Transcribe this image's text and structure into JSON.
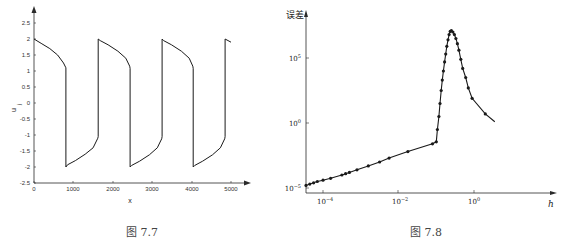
{
  "chart_data": [
    {
      "type": "line",
      "title": "",
      "caption": "图  7.7",
      "xlabel": "x",
      "ylabel": "u_j",
      "xlim": [
        0,
        5400
      ],
      "ylim": [
        -2.5,
        2.8
      ],
      "x_ticks": [
        "0",
        "1000",
        "2000",
        "3000",
        "4000",
        "5000"
      ],
      "y_ticks": [
        "2.5",
        "2",
        "1.5",
        "1",
        "0.5",
        "0",
        "-0.5",
        "-1",
        "-1.5",
        "-2",
        "-2.5"
      ],
      "grid": false,
      "series": [
        {
          "name": "u_j",
          "x": [
            0,
            200,
            400,
            600,
            750,
            810,
            810,
            850,
            1050,
            1300,
            1500,
            1620,
            1630,
            1630,
            1680,
            1880,
            2130,
            2330,
            2430,
            2440,
            2440,
            2480,
            2680,
            2930,
            3130,
            3240,
            3250,
            3250,
            3290,
            3490,
            3740,
            3940,
            4030,
            4040,
            4040,
            4080,
            4280,
            4530,
            4730,
            4840,
            4850,
            4850,
            5000
          ],
          "values": [
            2.0,
            1.85,
            1.7,
            1.5,
            1.25,
            1.1,
            -2.0,
            -1.93,
            -1.8,
            -1.6,
            -1.4,
            -1.1,
            -1.05,
            2.0,
            1.95,
            1.82,
            1.62,
            1.4,
            1.15,
            1.08,
            -2.0,
            -1.95,
            -1.82,
            -1.62,
            -1.4,
            -1.12,
            -1.05,
            2.0,
            1.95,
            1.82,
            1.62,
            1.4,
            1.15,
            1.08,
            -2.0,
            -1.95,
            -1.82,
            -1.62,
            -1.4,
            -1.12,
            -1.05,
            2.0,
            1.9
          ]
        }
      ]
    },
    {
      "type": "line",
      "title": "",
      "caption": "图  7.8",
      "xlabel": "h",
      "ylabel": "误差",
      "xscale": "log",
      "yscale": "log",
      "x_ticks": [
        "10^-4",
        "10^-2",
        "10^0"
      ],
      "y_ticks": [
        "10^5",
        "10^0",
        "10^-5"
      ],
      "grid": false,
      "series": [
        {
          "name": "error",
          "markers": true,
          "log10_h": [
            -4.45,
            -4.35,
            -4.25,
            -4.15,
            -4.0,
            -3.8,
            -3.5,
            -3.4,
            -3.3,
            -3.1,
            -2.8,
            -2.5,
            -2.25,
            -1.75,
            -1.1,
            -1.0,
            -0.97,
            -0.93,
            -0.9,
            -0.87,
            -0.84,
            -0.81,
            -0.78,
            -0.75,
            -0.72,
            -0.69,
            -0.66,
            -0.63,
            -0.6,
            -0.56,
            -0.52,
            -0.48,
            -0.44,
            -0.4,
            -0.35,
            -0.3,
            -0.22,
            -0.15,
            -0.05,
            0.3,
            0.55
          ],
          "log10_error": [
            -4.8,
            -4.7,
            -4.6,
            -4.5,
            -4.4,
            -4.25,
            -4.0,
            -3.9,
            -3.8,
            -3.6,
            -3.3,
            -3.0,
            -2.7,
            -2.2,
            -1.6,
            -1.45,
            -0.5,
            0.5,
            1.5,
            2.5,
            3.3,
            4.0,
            4.7,
            5.3,
            5.9,
            6.4,
            6.8,
            7.05,
            7.1,
            7.0,
            6.8,
            6.5,
            6.1,
            5.6,
            4.9,
            4.2,
            3.5,
            2.7,
            1.9,
            0.7,
            0.1
          ]
        }
      ]
    }
  ],
  "figures": {
    "left": {
      "caption": "图  7.7",
      "xlabel": "x",
      "ylabel_main": "u",
      "ylabel_sub": "j",
      "x_ticks": [
        {
          "label": "0",
          "x": 34
        },
        {
          "label": "1000",
          "x": 73
        },
        {
          "label": "2000",
          "x": 113
        },
        {
          "label": "3000",
          "x": 152
        },
        {
          "label": "4000",
          "x": 192
        },
        {
          "label": "5000",
          "x": 231
        }
      ],
      "y_ticks": [
        {
          "label": "2.5",
          "y": 23
        },
        {
          "label": "2",
          "y": 39
        },
        {
          "label": "1.5",
          "y": 55
        },
        {
          "label": "1",
          "y": 71
        },
        {
          "label": "0.5",
          "y": 87
        },
        {
          "label": "0",
          "y": 103
        },
        {
          "label": "-0.5",
          "y": 119
        },
        {
          "label": "-1",
          "y": 135
        },
        {
          "label": "-1.5",
          "y": 151
        },
        {
          "label": "-2",
          "y": 167
        },
        {
          "label": "-2.5",
          "y": 183
        }
      ]
    },
    "right": {
      "caption": "图  7.8",
      "xlabel": "h",
      "ylabel": "误差",
      "x_ticks": [
        {
          "base": "10",
          "exp": "−4",
          "x": 323
        },
        {
          "base": "10",
          "exp": "−2",
          "x": 398
        },
        {
          "base": "10",
          "exp": "0",
          "x": 474
        }
      ],
      "y_ticks": [
        {
          "base": "10",
          "exp": "5",
          "y": 58
        },
        {
          "base": "10",
          "exp": "0",
          "y": 123
        },
        {
          "base": "10",
          "exp": "−5",
          "y": 188
        }
      ]
    }
  },
  "colors": {
    "line": "#1a1a1a",
    "axis": "#2a2a2a",
    "text": "#333333",
    "background": "#ffffff"
  }
}
